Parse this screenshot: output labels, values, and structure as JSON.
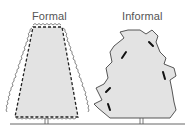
{
  "diagram": {
    "labels": {
      "formal": "Formal",
      "informal": "Informal"
    },
    "colors": {
      "foliage_fill": "#e3e3e3",
      "outline": "#444444",
      "cut_line": "#222222",
      "ground": "#555555",
      "label_text": "#555555"
    },
    "nodes": [
      {
        "id": "formal-hedge",
        "label": "Formal",
        "shape": "trapezoid with dashed trim line"
      },
      {
        "id": "informal-hedge",
        "label": "Informal",
        "shape": "irregular natural outline with selective cut marks"
      }
    ]
  }
}
